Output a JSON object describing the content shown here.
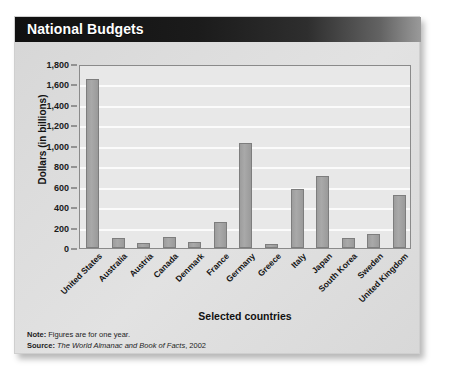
{
  "card": {
    "title": "National Budgets"
  },
  "notes": {
    "note_label": "Note:",
    "note_text": "Figures are for one year.",
    "source_label": "Source:",
    "source_title": "The World Almanac and Book of Facts",
    "source_year": ", 2002"
  },
  "colors": {
    "title_band": "#101010",
    "bar_fill": "#a9a9a9",
    "bar_stroke": "#7d7d7d",
    "plot_bg": "#e8e8e8",
    "gridline": "#fbfbfb",
    "card_bg": "#dcdcdc"
  },
  "chart_data": {
    "type": "bar",
    "title": "National Budgets",
    "xlabel": "Selected countries",
    "ylabel": "Dollars (in billions)",
    "ylim": [
      0,
      1800
    ],
    "ytick_step": 200,
    "ytick_labels": [
      "1,800",
      "1,600",
      "1,400",
      "1,200",
      "1,000",
      "800",
      "600",
      "400",
      "200",
      "0"
    ],
    "ytick_values": [
      1800,
      1600,
      1400,
      1200,
      1000,
      800,
      600,
      400,
      200,
      0
    ],
    "grid": true,
    "grid_axis": "y",
    "legend": false,
    "categories": [
      "United States",
      "Australia",
      "Austria",
      "Canada",
      "Denmark",
      "France",
      "Germany",
      "Greece",
      "Italy",
      "Japan",
      "South Korea",
      "Sweden",
      "United Kingdom"
    ],
    "values": [
      1650,
      100,
      50,
      110,
      60,
      255,
      1030,
      35,
      580,
      700,
      95,
      140,
      520
    ]
  }
}
